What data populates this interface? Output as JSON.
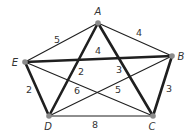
{
  "graph": {
    "title": "",
    "colors": {
      "edge": "#1f1f1f",
      "vertex": "#8a8a8a",
      "text": "#333333",
      "background": "#ffffff"
    },
    "vertices": [
      {
        "id": "A",
        "label": "A",
        "x": 98,
        "y": 23,
        "label_x": 98,
        "label_y": 15
      },
      {
        "id": "B",
        "label": "B",
        "x": 172,
        "y": 56,
        "label_x": 181,
        "label_y": 60
      },
      {
        "id": "C",
        "label": "C",
        "x": 153,
        "y": 116,
        "label_x": 152,
        "label_y": 130
      },
      {
        "id": "D",
        "label": "D",
        "x": 49,
        "y": 116,
        "label_x": 48,
        "label_y": 130
      },
      {
        "id": "E",
        "label": "E",
        "x": 25,
        "y": 62,
        "label_x": 15,
        "label_y": 66
      }
    ],
    "edges": [
      {
        "from": "A",
        "to": "E",
        "weight": "5",
        "thick": false,
        "label_x": 57,
        "label_y": 43
      },
      {
        "from": "A",
        "to": "B",
        "weight": "4",
        "thick": false,
        "label_x": 139,
        "label_y": 36
      },
      {
        "from": "E",
        "to": "B",
        "weight": "4",
        "thick": true,
        "label_x": 98,
        "label_y": 54
      },
      {
        "from": "A",
        "to": "D",
        "weight": "2",
        "thick": true,
        "label_x": 81,
        "label_y": 75
      },
      {
        "from": "A",
        "to": "C",
        "weight": "3",
        "thick": true,
        "label_x": 119,
        "label_y": 73
      },
      {
        "from": "E",
        "to": "D",
        "weight": "2",
        "thick": true,
        "label_x": 29,
        "label_y": 93
      },
      {
        "from": "E",
        "to": "C",
        "weight": "6",
        "thick": false,
        "label_x": 77,
        "label_y": 94
      },
      {
        "from": "D",
        "to": "B",
        "weight": "5",
        "thick": false,
        "label_x": 118,
        "label_y": 93
      },
      {
        "from": "B",
        "to": "C",
        "weight": "3",
        "thick": true,
        "label_x": 169,
        "label_y": 92
      },
      {
        "from": "D",
        "to": "C",
        "weight": "8",
        "thick": false,
        "label_x": 95,
        "label_y": 128
      }
    ]
  }
}
